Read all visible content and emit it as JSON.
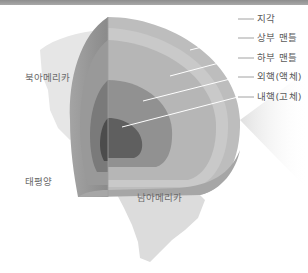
{
  "diagram": {
    "layers": [
      {
        "label": "지각",
        "color": "#b9b9b9"
      },
      {
        "label": "상부 맨틀",
        "color": "#c6c6c6"
      },
      {
        "label": "하부 맨틀",
        "color": "#b0b0b0"
      },
      {
        "label": "외핵(액체)",
        "color": "#8f8f8f"
      },
      {
        "label": "내핵(고체)",
        "color": "#5e5e5e"
      }
    ],
    "regions": {
      "north_america": "북아메리카",
      "pacific": "태평양",
      "south_america": "남아메리카"
    }
  }
}
